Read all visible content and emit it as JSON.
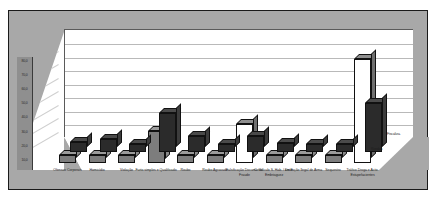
{
  "chart_data": {
    "type": "bar",
    "title": "",
    "xlabel": "",
    "ylabel": "",
    "ylim": [
      0,
      80
    ],
    "grid": true,
    "three_d": true,
    "legend_position": "depth-axis-right",
    "ytick_labels": [
      "80,0",
      "70,0",
      "60,0",
      "50,0",
      "40,0",
      "30,0",
      "20,0",
      "10,0"
    ],
    "ytick_values": [
      80,
      70,
      60,
      50,
      40,
      30,
      20,
      10
    ],
    "categories": [
      "Ofensas Corporais",
      "Homicídio",
      "Violação",
      "Furto simples e Qualificado",
      "Roubo",
      "Roubo Agravado",
      "Falsificação Documental Fraude",
      "C. Veículo S. Hab. / em E. Embriaguez",
      "Detenção Ilegal de Arma",
      "Sequestro",
      "Tráfico Droga e Activ. Estupefacientes"
    ],
    "series": [
      {
        "name": "Rondas",
        "values": [
          8,
          10,
          6,
          30,
          12,
          6,
          12,
          7,
          6,
          6,
          38
        ]
      },
      {
        "name": "Fiscaliza.",
        "values": [
          6,
          6,
          6,
          25,
          6,
          6,
          30,
          6,
          6,
          6,
          80
        ]
      }
    ]
  },
  "axis": {
    "depth_labels": [
      "Fiscaliza.",
      "Rondas"
    ]
  }
}
